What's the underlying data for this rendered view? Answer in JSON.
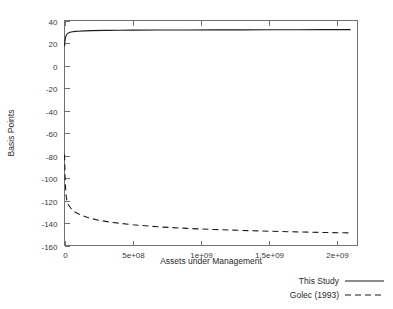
{
  "chart_data": {
    "type": "line",
    "title": "",
    "xlabel": "Assets under Management",
    "ylabel": "Basis Points",
    "xlim": [
      0,
      2150000000
    ],
    "ylim": [
      -160,
      40
    ],
    "grid": false,
    "legend_position": "below-right",
    "xticks": [
      0,
      500000000,
      1000000000,
      1500000000,
      2000000000
    ],
    "xtick_labels": [
      "0",
      "5e+08",
      "1e+09",
      "1.5e+09",
      "2e+09"
    ],
    "yticks": [
      -160,
      -140,
      -120,
      -100,
      -80,
      -60,
      -40,
      -20,
      0,
      20,
      40
    ],
    "ytick_labels": [
      "-160",
      "-140",
      "-120",
      "-100",
      "-80",
      "-60",
      "-40",
      "-20",
      "0",
      "20",
      "40"
    ],
    "series": [
      {
        "name": "This Study",
        "style": "solid",
        "color": "#1b1b1b",
        "x": [
          0,
          5000000,
          10000000,
          15000000,
          20000000,
          30000000,
          40000000,
          60000000,
          80000000,
          100000000,
          150000000,
          200000000,
          300000000,
          400000000,
          500000000,
          700000000,
          900000000,
          1100000000,
          1300000000,
          1500000000,
          1700000000,
          1900000000,
          2100000000
        ],
        "values": [
          17.0,
          23.5,
          26.0,
          27.3,
          28.1,
          29.0,
          29.5,
          30.0,
          30.3,
          30.5,
          30.8,
          31.0,
          31.2,
          31.3,
          31.4,
          31.5,
          31.6,
          31.7,
          31.7,
          31.8,
          31.8,
          31.9,
          31.9
        ]
      },
      {
        "name": "Golec (1993)",
        "style": "dashed",
        "color": "#1b1b1b",
        "x": [
          0,
          3000000,
          6000000,
          10000000,
          15000000,
          20000000,
          30000000,
          50000000,
          80000000,
          120000000,
          180000000,
          250000000,
          350000000,
          500000000,
          700000000,
          900000000,
          1100000000,
          1300000000,
          1500000000,
          1700000000,
          1900000000,
          2100000000
        ],
        "values": [
          -79.0,
          -93.0,
          -104.0,
          -113.0,
          -118.5,
          -121.0,
          -124.0,
          -127.5,
          -130.5,
          -133.0,
          -135.5,
          -137.5,
          -139.5,
          -141.5,
          -143.5,
          -144.8,
          -145.8,
          -146.6,
          -147.3,
          -147.9,
          -148.4,
          -148.8
        ]
      }
    ]
  },
  "legend": {
    "entries": [
      {
        "label": "This Study",
        "style": "solid"
      },
      {
        "label": "Golec (1993)",
        "style": "dashed"
      }
    ]
  }
}
